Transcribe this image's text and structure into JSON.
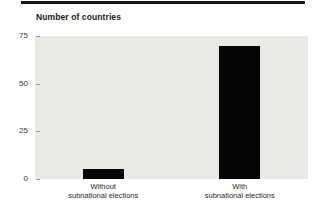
{
  "figure": {
    "title": "Number of countries"
  },
  "colors": {
    "top_rule": "#141414",
    "bar": "#050505",
    "plot_background": "#e9e9e6",
    "title_text": "#1a1a1a",
    "tick_text": "#3a3a3a"
  },
  "chart_data": {
    "type": "bar",
    "title": "Number of countries",
    "categories": [
      "Without\nsubnational elections",
      "With\nsubnational elections"
    ],
    "values": [
      5,
      70
    ],
    "xlabel": "",
    "ylabel": "Number of countries",
    "ylim": [
      0,
      75
    ],
    "yticks": [
      0,
      25,
      50,
      75
    ],
    "grid": false,
    "legend": "none",
    "bar_width_px": 41
  }
}
